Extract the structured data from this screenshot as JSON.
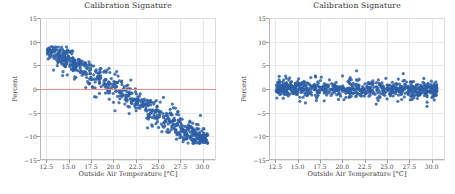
{
  "figure": {
    "background": "#ffffff",
    "point_color": "#2d5fa6",
    "zero_line_color": "#f08a82",
    "grid_color": "#e9e9e9"
  },
  "chart_data": [
    {
      "type": "scatter",
      "panel": "left",
      "title": "Calibration Signature",
      "xlabel": "Outside Air Temperature [°C]",
      "ylabel": "Percent",
      "xlim": [
        11.8,
        31.5
      ],
      "ylim": [
        -15,
        15
      ],
      "xticks": [
        12.5,
        15.0,
        17.5,
        20.0,
        22.5,
        25.0,
        27.5,
        30.0
      ],
      "xticklabels": [
        "12.5",
        "15.0",
        "17.5",
        "20.0",
        "22.5",
        "25.0",
        "27.5",
        "30.0"
      ],
      "yticks": [
        -15,
        -10,
        -5,
        0,
        5,
        10,
        15
      ],
      "yticklabels": [
        "−15",
        "−10",
        "−5",
        "0",
        "5",
        "10",
        "15"
      ],
      "grid": true,
      "legend": null,
      "reference_line": {
        "y": 0,
        "color": "#f08a82"
      },
      "n_points": 760,
      "description": "Dense negatively-sloped cloud: values near +8 percent at 13 C falling to about −10 percent at 29 C, crossing zero near 20.5 C.",
      "trend": {
        "intercept_at_x0": 23.5,
        "slope": -1.15,
        "x_ref": 0,
        "spread": 2.1
      },
      "series": [
        {
          "name": "calibration residuals",
          "color": "#2d5fa6",
          "marker": "o",
          "marker_size": 1.6,
          "x_range": [
            12.6,
            30.6
          ],
          "y_range": [
            -11.5,
            9.0
          ]
        }
      ]
    },
    {
      "type": "scatter",
      "panel": "right",
      "title": "Calibration Signature",
      "xlabel": "Outside Air Temperature [°C]",
      "ylabel": "Percent",
      "xlim": [
        11.8,
        31.5
      ],
      "ylim": [
        -15,
        15
      ],
      "xticks": [
        12.5,
        15.0,
        17.5,
        20.0,
        22.5,
        25.0,
        27.5,
        30.0
      ],
      "xticklabels": [
        "12.5",
        "15.0",
        "17.5",
        "20.0",
        "22.5",
        "25.0",
        "27.5",
        "30.0"
      ],
      "yticks": [
        -15,
        -10,
        -5,
        0,
        5,
        10,
        15
      ],
      "yticklabels": [
        "−15",
        "−10",
        "−5",
        "0",
        "5",
        "10",
        "15"
      ],
      "grid": true,
      "legend": null,
      "reference_line": null,
      "n_points": 760,
      "description": "Flat cloud centred on zero percent across the whole temperature range, spread roughly −4 to +4 percent, slightly wider above 24 C.",
      "trend": {
        "intercept_at_x0": 0.55,
        "slope": -0.025,
        "x_ref": 0,
        "spread": 1.35
      },
      "series": [
        {
          "name": "calibration residuals",
          "color": "#2d5fa6",
          "marker": "o",
          "marker_size": 1.6,
          "x_range": [
            12.6,
            30.6
          ],
          "y_range": [
            -4.6,
            5.0
          ]
        }
      ]
    }
  ]
}
